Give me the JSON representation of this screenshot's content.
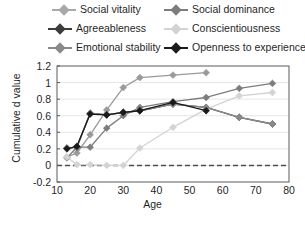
{
  "chart_data": {
    "type": "line",
    "title": "",
    "xlabel": "Age",
    "ylabel": "Cumulative d value",
    "xlim": [
      10,
      80
    ],
    "ylim": [
      -0.2,
      1.2
    ],
    "xticks": [
      10,
      20,
      30,
      40,
      50,
      60,
      70,
      80
    ],
    "yticks": [
      -0.2,
      0,
      0.2,
      0.4,
      0.6,
      0.8,
      1,
      1.2
    ],
    "ytick_labels": [
      "-0.2",
      "0",
      "0.2",
      "0.4",
      "0.6",
      "0.8",
      "1",
      "1.2"
    ],
    "xtick_labels": [
      "10",
      "20",
      "30",
      "40",
      "50",
      "60",
      "70",
      "80"
    ],
    "grid": "horizontal",
    "zero_reference_line": 0,
    "legend_position": "top",
    "marker": "diamond",
    "x": [
      13,
      16,
      20,
      25,
      30,
      35,
      45,
      55,
      65,
      75
    ],
    "series": [
      {
        "name": "Social vitality",
        "color": "#9a9a9a",
        "values": [
          0.1,
          0.15,
          0.37,
          0.67,
          0.94,
          1.06,
          1.09,
          1.12,
          null,
          null
        ]
      },
      {
        "name": "Social dominance",
        "color": "#7d7d7d",
        "values": [
          0.09,
          0.22,
          0.22,
          0.45,
          0.6,
          0.7,
          0.77,
          0.82,
          0.93,
          0.99
        ]
      },
      {
        "name": "Agreeableness",
        "color": "#3c3c3c",
        "values": [
          0.21,
          0.22,
          0.63,
          0.61,
          0.64,
          0.66,
          0.74,
          0.7,
          0.58,
          0.5
        ]
      },
      {
        "name": "Conscientiousness",
        "color": "#d3d3d3",
        "values": [
          0.1,
          0.01,
          0.01,
          0.0,
          0.0,
          0.21,
          0.46,
          0.68,
          0.84,
          0.88
        ]
      },
      {
        "name": "Emotional stability",
        "color": "#8a8a8a",
        "values": [
          0.21,
          0.22,
          0.63,
          0.61,
          0.64,
          0.66,
          0.74,
          0.7,
          0.58,
          0.5
        ]
      },
      {
        "name": "Openness to experience",
        "color": "#1a1a1a",
        "values": [
          0.2,
          0.23,
          0.62,
          0.61,
          0.64,
          0.66,
          0.76,
          0.66,
          null,
          null
        ]
      }
    ]
  },
  "legend": {
    "items": [
      {
        "label": "Social vitality",
        "color": "#a8a8a8"
      },
      {
        "label": "Social dominance",
        "color": "#7d7d7d"
      },
      {
        "label": "Agreeableness",
        "color": "#3c3c3c"
      },
      {
        "label": "Conscientiousness",
        "color": "#d3d3d3"
      },
      {
        "label": "Emotional stability",
        "color": "#8a8a8a"
      },
      {
        "label": "Openness to experience",
        "color": "#1a1a1a"
      }
    ]
  }
}
